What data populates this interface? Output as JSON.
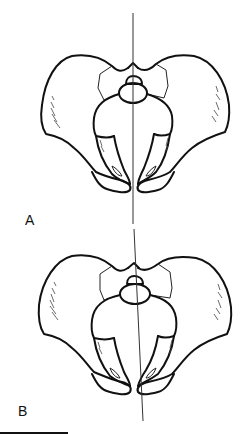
{
  "figure": {
    "panels": [
      {
        "id": "A",
        "label": "A",
        "midline": "vertical",
        "description": "pelvis, symmetric alignment"
      },
      {
        "id": "B",
        "label": "B",
        "midline": "tilted",
        "description": "pelvis, asymmetric alignment"
      }
    ],
    "scale_bar": true,
    "colors": {
      "stroke": "#111111",
      "background": "#ffffff"
    }
  }
}
